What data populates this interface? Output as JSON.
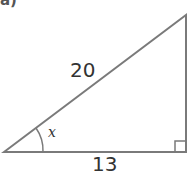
{
  "part_label": "a)",
  "diagram": {
    "type": "right-triangle",
    "hypotenuse_label": "20",
    "base_label": "13",
    "angle_label": "x",
    "right_angle_marker": true,
    "stroke_color": "#777777"
  }
}
